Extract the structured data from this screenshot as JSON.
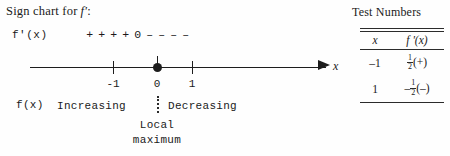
{
  "title": {
    "text": "Sign chart for",
    "function": "f′",
    "colon": ":"
  },
  "sign_row": {
    "function_label": "f'(x)",
    "signs": [
      "+",
      "+",
      "+",
      "+"
    ],
    "zero": "0",
    "negatives": [
      "–",
      "–",
      "–",
      "–"
    ]
  },
  "axis": {
    "variable": "x",
    "ticks": [
      {
        "label": "-1",
        "value": -1
      },
      {
        "label": "0",
        "value": 0
      },
      {
        "label": "1",
        "value": 1
      }
    ],
    "critical_point": "0"
  },
  "behavior": {
    "function_label": "f(x)",
    "left_interval": "Increasing",
    "right_interval": "Decreasing",
    "annotation_line1": "Local",
    "annotation_line2": "maximum"
  },
  "test_numbers": {
    "title": "Test Numbers",
    "columns": [
      "x",
      "f '(x)"
    ],
    "rows": [
      {
        "x": "–1",
        "neg": "",
        "num": "1",
        "den": "2",
        "sign": "(+)"
      },
      {
        "x": "1",
        "neg": "–",
        "num": "1",
        "den": "2",
        "sign": "(–)"
      }
    ]
  },
  "colors": {
    "ink": "#1d1d1d",
    "background": "#fefefe"
  },
  "chart_data": {
    "type": "line",
    "xlabel": "x",
    "ylabel": "",
    "xlim": [
      -2.8,
      2.6
    ],
    "grid": false,
    "legend": "none",
    "categories": [
      "-1",
      "0",
      "1"
    ],
    "annotations": [
      {
        "x": -1,
        "text": "-1",
        "kind": "tick"
      },
      {
        "x": 0,
        "text": "0",
        "kind": "critical-point"
      },
      {
        "x": 1,
        "text": "1",
        "kind": "tick"
      },
      {
        "x": -0.9,
        "text": "+ + + +",
        "kind": "sign-of-derivative"
      },
      {
        "x": 0,
        "text": "0",
        "kind": "sign-of-derivative"
      },
      {
        "x": 0.9,
        "text": "– – – –",
        "kind": "sign-of-derivative"
      },
      {
        "x": -1.0,
        "text": "Increasing",
        "kind": "behavior"
      },
      {
        "x": 1.0,
        "text": "Decreasing",
        "kind": "behavior"
      },
      {
        "x": 0,
        "text": "Local maximum",
        "kind": "extremum"
      }
    ],
    "series": [
      {
        "name": "f'(x) sign",
        "x": [
          -1,
          0,
          1
        ],
        "values": [
          0.5,
          0,
          -0.5
        ]
      }
    ]
  }
}
